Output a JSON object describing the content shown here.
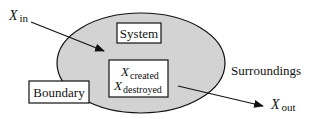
{
  "diagram": {
    "system_label": "System",
    "boundary_label": "Boundary",
    "surroundings_label": "Surroundings",
    "inflow": {
      "symbol": "X",
      "subscript": "in"
    },
    "outflow": {
      "symbol": "X",
      "subscript": "out"
    },
    "internal": {
      "created": {
        "symbol": "X",
        "subscript": "created"
      },
      "destroyed": {
        "symbol": "X",
        "subscript": "destroyed"
      }
    },
    "colors": {
      "system_fill": "#d3d3d3",
      "stroke": "#111111",
      "box_fill": "#ffffff"
    }
  }
}
